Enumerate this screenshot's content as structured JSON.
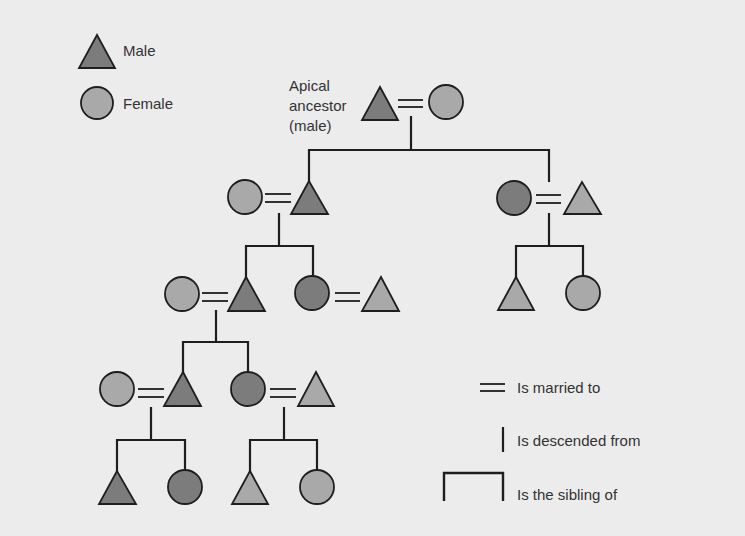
{
  "legend": {
    "male_label": "Male",
    "female_label": "Female",
    "married_label": "Is married to",
    "descended_label": "Is descended from",
    "sibling_label": "Is the sibling of"
  },
  "apical": {
    "line1": "Apical",
    "line2": "ancestor",
    "line3": "(male)"
  },
  "colors": {
    "background": "#ececec",
    "lineage_fill": "#7c7c7c",
    "spouse_fill": "#a9a9a9",
    "stroke": "#1e1e1e"
  }
}
